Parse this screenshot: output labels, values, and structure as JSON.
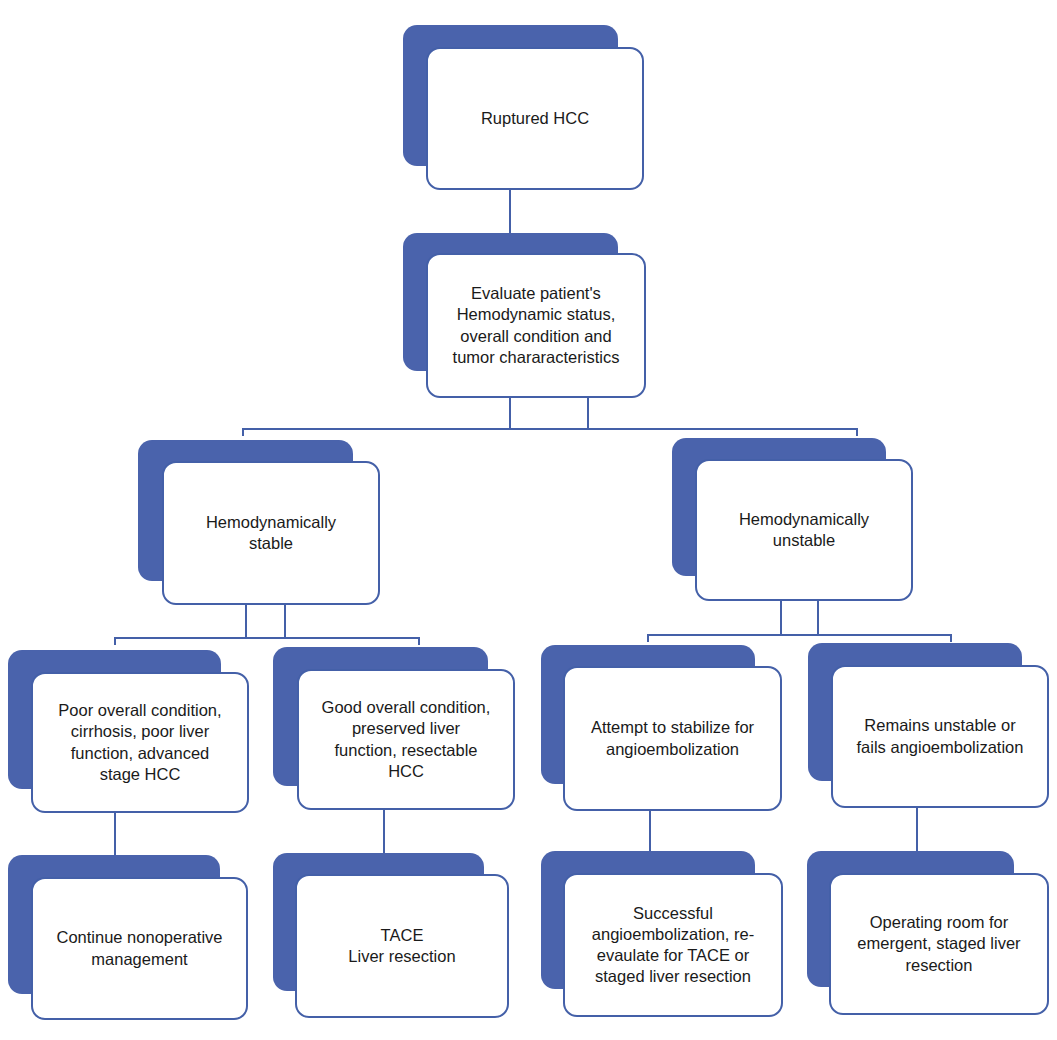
{
  "diagram": {
    "type": "flowchart",
    "colors": {
      "box_shadow": "#4a63ac",
      "box_border": "#4460a8",
      "connector": "#4460a8",
      "box_fill": "#ffffff",
      "text": "#1a1a1a"
    },
    "nodes": {
      "root": {
        "label": "Ruptured HCC"
      },
      "evaluate": {
        "label": "Evaluate patient's\nHemodynamic status,\noverall condition  and\ntumor chararacteristics"
      },
      "stable": {
        "label": "Hemodynamically\nstable"
      },
      "unstable": {
        "label": "Hemodynamically\nunstable"
      },
      "poor": {
        "label": "Poor overall condition,\ncirrhosis, poor liver\nfunction, advanced\nstage HCC"
      },
      "good": {
        "label": "Good overall condition,\npreserved liver\nfunction, resectable\nHCC"
      },
      "attempt": {
        "label": "Attempt to stabilize for\nangioembolization"
      },
      "remains": {
        "label": "Remains unstable or\nfails angioembolization"
      },
      "continue": {
        "label": "Continue nonoperative\nmanagement"
      },
      "tace": {
        "label": "TACE\nLiver resection"
      },
      "successful": {
        "label": "Successful\nangioembolization, re-\nevaulate for TACE or\nstaged liver resection"
      },
      "operating": {
        "label": "Operating room for\nemergent, staged liver\nresection"
      }
    },
    "edges": [
      [
        "root",
        "evaluate"
      ],
      [
        "evaluate",
        "stable"
      ],
      [
        "evaluate",
        "unstable"
      ],
      [
        "stable",
        "poor"
      ],
      [
        "stable",
        "good"
      ],
      [
        "unstable",
        "attempt"
      ],
      [
        "unstable",
        "remains"
      ],
      [
        "poor",
        "continue"
      ],
      [
        "good",
        "tace"
      ],
      [
        "attempt",
        "successful"
      ],
      [
        "remains",
        "operating"
      ]
    ]
  }
}
